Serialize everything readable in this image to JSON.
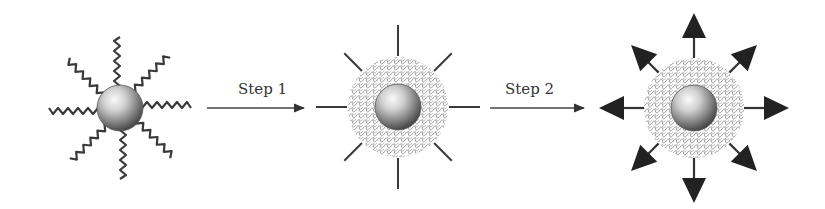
{
  "diagram": {
    "type": "process-flow",
    "stages": [
      {
        "id": "stage-1",
        "description": "Nanoparticle with wavy polymer ligand chains",
        "center": [
          120,
          108
        ]
      },
      {
        "id": "stage-2",
        "description": "Nanoparticle with mesh shell and straight linker spikes",
        "center": [
          398,
          107
        ]
      },
      {
        "id": "stage-3",
        "description": "Nanoparticle with mesh shell and outward-pointing arrows",
        "center": [
          694,
          108
        ]
      }
    ],
    "transitions": [
      {
        "label": "Step 1",
        "from": "stage-1",
        "to": "stage-2"
      },
      {
        "label": "Step 2",
        "from": "stage-2",
        "to": "stage-3"
      }
    ]
  },
  "colors": {
    "line": "#333333",
    "arrowhead": "#222222",
    "mesh": "#8a8a8a",
    "sphere_light": "#f4f4f4",
    "sphere_dark": "#4a4a4a",
    "background": "#ffffff"
  }
}
